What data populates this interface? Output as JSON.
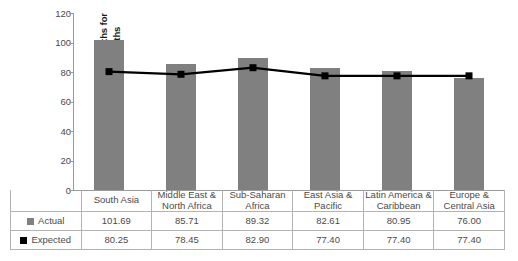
{
  "chart_data": {
    "type": "bar",
    "title": "",
    "xlabel": "",
    "ylabel": "Number of female (age 0–5) deaths for every 100 male (age 0–5) deaths",
    "ylabel_line1": "Number of female (age 0–5) deaths for",
    "ylabel_line2": "every 100 male (age 0–5) deaths",
    "ylim": [
      0,
      120
    ],
    "yticks": [
      0,
      20,
      40,
      60,
      80,
      100,
      120
    ],
    "ytick_labels": [
      "0",
      "20",
      "40",
      "60",
      "80",
      "100",
      "120"
    ],
    "grid": false,
    "legend_position": "table-left",
    "categories": [
      "South Asia",
      "Middle East & North Africa",
      "Sub-Saharan Africa",
      "East Asia & Pacific",
      "Latin America & Caribbean",
      "Europe & Central Asia"
    ],
    "category_lines": [
      [
        "South Asia",
        ""
      ],
      [
        "Middle East &",
        "North Africa"
      ],
      [
        "Sub-Saharan",
        "Africa"
      ],
      [
        "East Asia &",
        "Pacific"
      ],
      [
        "Latin America &",
        "Caribbean"
      ],
      [
        "Europe &",
        "Central Asia"
      ]
    ],
    "series": [
      {
        "name": "Actual",
        "render": "bar",
        "color": "#808080",
        "values": [
          101.69,
          85.71,
          89.32,
          82.61,
          80.95,
          76.0
        ],
        "labels": [
          "101.69",
          "85.71",
          "89.32",
          "82.61",
          "80.95",
          "76.00"
        ]
      },
      {
        "name": "Expected",
        "render": "line-marker",
        "color": "#000000",
        "values": [
          80.25,
          78.45,
          82.9,
          77.4,
          77.4,
          77.4
        ],
        "labels": [
          "80.25",
          "78.45",
          "82.90",
          "77.40",
          "77.40",
          "77.40"
        ]
      }
    ]
  },
  "legend": {
    "actual_label": "Actual",
    "expected_label": "Expected",
    "actual_color": "#808080",
    "expected_color": "#000000"
  }
}
